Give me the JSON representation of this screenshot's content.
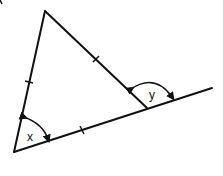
{
  "diagram": {
    "type": "geometry",
    "colors": {
      "stroke": "#111111",
      "background": "#ffffff"
    },
    "vertices": {
      "top": [
        45,
        11
      ],
      "bottom_left": [
        14,
        152
      ],
      "right": [
        147,
        108
      ]
    },
    "extension_end": [
      212,
      88
    ],
    "equal_side_ticks": 3,
    "angles": {
      "x": {
        "label": "x",
        "vertex": "bottom_left",
        "kind": "interior"
      },
      "y": {
        "label": "y",
        "vertex": "right",
        "kind": "exterior"
      }
    }
  }
}
